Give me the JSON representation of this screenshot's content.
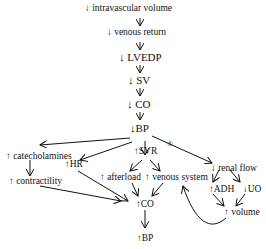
{
  "nodes": {
    "intravascular_volume": "↓ intravascular volume",
    "venous_return": "↓ venous return",
    "lvedp": "↓ LVEDP",
    "sv": "↓ SV",
    "co_down": "↓ CO",
    "bp_down": "↓BP",
    "svr": "↑SVR",
    "svr_marker": "①",
    "catecholamines": "↑ catecholamines",
    "contractility": "↑ contractility",
    "hr": "↑HR",
    "afterload": "↑ afterload",
    "venous_system": "↑ venous system",
    "renal_flow": "↓ renal flow",
    "adh": "↑ADH",
    "uo": "↓UO",
    "volume": "↑ volume",
    "co_up": "↑CO",
    "bp_up": "↑BP"
  },
  "chain_arrows": [
    "↓",
    "↓",
    "↓",
    "↓",
    "↓"
  ]
}
